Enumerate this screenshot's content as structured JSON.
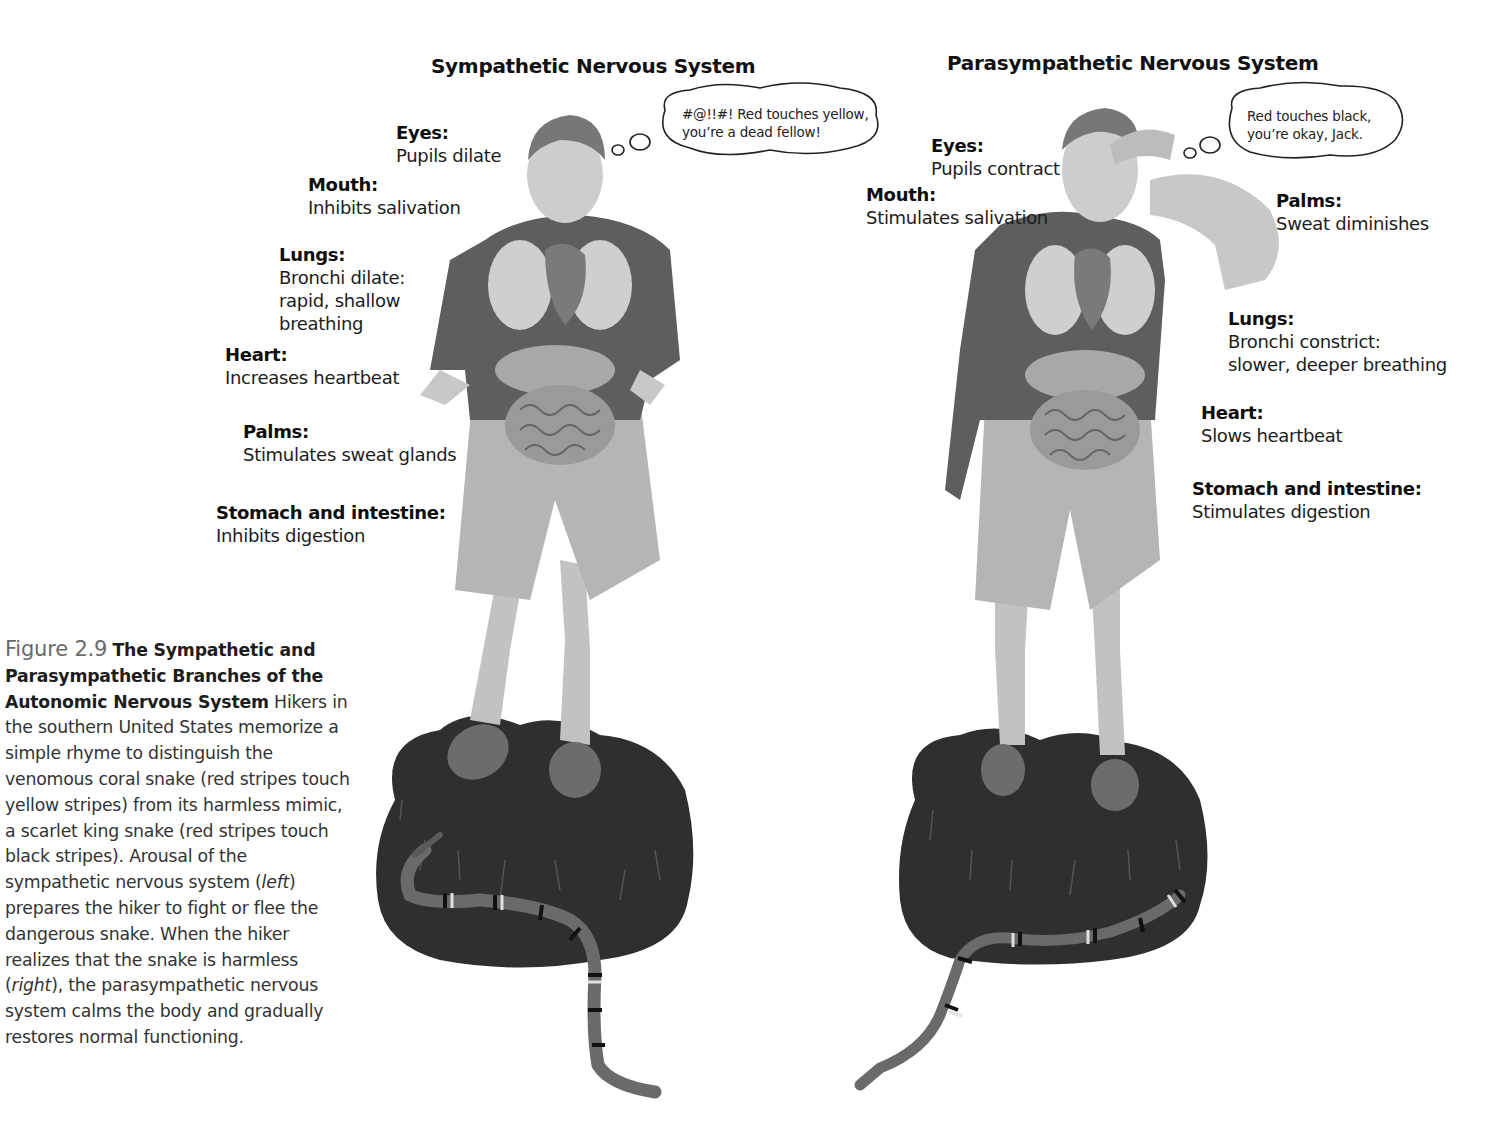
{
  "figure": {
    "number": "Figure 2.9",
    "title": "The Sympathetic and Parasympathetic Branches of the Autonomic Nervous System",
    "caption_parts": {
      "p1": "Hikers in the southern United States memorize a simple rhyme to distinguish the venomous coral snake (red stripes touch yellow stripes) from its harmless mimic, a scarlet king snake (red stripes touch black stripes). Arousal of the sympathetic nervous system (",
      "em1": "left",
      "p2": ") prepares the hiker to fight or flee the dangerous snake. When the hiker realizes that the snake is harmless (",
      "em2": "right",
      "p3": "), the parasympathetic nervous system calms the body and gradually restores normal functioning."
    }
  },
  "left_panel": {
    "title": "Sympathetic Nervous System",
    "thought": "#@!!#! Red touches yellow,\nyou’re a dead fellow!",
    "labels": {
      "eyes": {
        "head": "Eyes:",
        "body": "Pupils dilate"
      },
      "mouth": {
        "head": "Mouth:",
        "body": "Inhibits salivation"
      },
      "lungs": {
        "head": "Lungs:",
        "body": "Bronchi dilate:\nrapid, shallow\nbreathing"
      },
      "heart": {
        "head": "Heart:",
        "body": "Increases heartbeat"
      },
      "palms": {
        "head": "Palms:",
        "body": "Stimulates sweat glands"
      },
      "stomach": {
        "head": "Stomach and intestine:",
        "body": "Inhibits digestion"
      }
    }
  },
  "right_panel": {
    "title": "Parasympathetic Nervous System",
    "thought": "Red touches black,\nyou’re okay, Jack.",
    "labels": {
      "eyes": {
        "head": "Eyes:",
        "body": "Pupils contract"
      },
      "mouth": {
        "head": "Mouth:",
        "body": "Stimulates salivation"
      },
      "palms": {
        "head": "Palms:",
        "body": "Sweat diminishes"
      },
      "lungs": {
        "head": "Lungs:",
        "body": "Bronchi constrict:\nslower, deeper breathing"
      },
      "heart": {
        "head": "Heart:",
        "body": "Slows heartbeat"
      },
      "stomach": {
        "head": "Stomach and intestine:",
        "body": "Stimulates digestion"
      }
    }
  },
  "colors": {
    "text": "#1c1c1c",
    "figure_number": "#6a6a6a",
    "grass": "#2e2e2e",
    "shirt": "#5e5e5e",
    "shorts": "#b3b3b3",
    "skin": "#c9c9c9"
  }
}
